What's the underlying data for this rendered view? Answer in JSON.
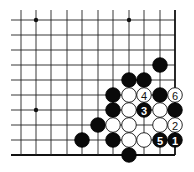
{
  "diagram": {
    "type": "go-board-fragment",
    "grid": {
      "columns": 11,
      "rows": 10,
      "col_x": [
        21,
        36,
        51,
        67,
        82,
        98,
        113,
        129,
        144,
        160,
        175
      ],
      "row_y": [
        20,
        35,
        50,
        65,
        80,
        95,
        110,
        125,
        140,
        155
      ],
      "line_start_x": 11,
      "line_start_y": 10,
      "right_edge": true,
      "bottom_edge": true
    },
    "hoshi": [
      {
        "col": 1,
        "row": 0
      },
      {
        "col": 7,
        "row": 0
      },
      {
        "col": 1,
        "row": 6
      }
    ],
    "stone_radius": 7.3,
    "stones": [
      {
        "color": "black",
        "col": 9,
        "row": 3,
        "label": ""
      },
      {
        "color": "black",
        "col": 7,
        "row": 4,
        "label": ""
      },
      {
        "color": "black",
        "col": 8,
        "row": 4,
        "label": ""
      },
      {
        "color": "black",
        "col": 6,
        "row": 5,
        "label": ""
      },
      {
        "color": "white",
        "col": 7,
        "row": 5,
        "label": ""
      },
      {
        "color": "white",
        "col": 8,
        "row": 5,
        "label": "4"
      },
      {
        "color": "black",
        "col": 9,
        "row": 5,
        "label": ""
      },
      {
        "color": "white",
        "col": 10,
        "row": 5,
        "label": "6"
      },
      {
        "color": "black",
        "col": 6,
        "row": 6,
        "label": ""
      },
      {
        "color": "white",
        "col": 7,
        "row": 6,
        "label": ""
      },
      {
        "color": "black",
        "col": 8,
        "row": 6,
        "label": "3"
      },
      {
        "color": "white",
        "col": 9,
        "row": 6,
        "label": ""
      },
      {
        "color": "black",
        "col": 10,
        "row": 6,
        "label": ""
      },
      {
        "color": "black",
        "col": 5,
        "row": 7,
        "label": ""
      },
      {
        "color": "white",
        "col": 6,
        "row": 7,
        "label": ""
      },
      {
        "color": "white",
        "col": 7,
        "row": 7,
        "label": ""
      },
      {
        "color": "white",
        "col": 9,
        "row": 7,
        "label": ""
      },
      {
        "color": "white",
        "col": 10,
        "row": 7,
        "label": "2"
      },
      {
        "color": "black",
        "col": 4,
        "row": 8,
        "label": ""
      },
      {
        "color": "black",
        "col": 6,
        "row": 8,
        "label": ""
      },
      {
        "color": "white",
        "col": 7,
        "row": 8,
        "label": ""
      },
      {
        "color": "white",
        "col": 8,
        "row": 8,
        "label": ""
      },
      {
        "color": "black",
        "col": 9,
        "row": 8,
        "label": "5"
      },
      {
        "color": "black",
        "col": 10,
        "row": 8,
        "label": "1"
      },
      {
        "color": "black",
        "col": 7,
        "row": 9,
        "label": ""
      }
    ]
  }
}
